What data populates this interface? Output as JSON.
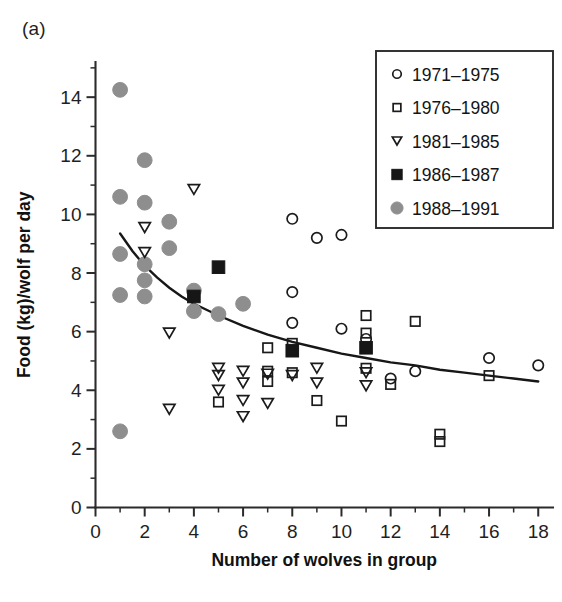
{
  "figure": {
    "panel_label": "(a)",
    "background_color": "#ffffff"
  },
  "chart_data": {
    "type": "scatter",
    "title": "(a)",
    "xlabel": "Number of wolves in group",
    "ylabel": "Food (kg)/wolf per day",
    "xlim": [
      0,
      18.6
    ],
    "ylim": [
      0,
      15.2
    ],
    "xticks": [
      0,
      2,
      4,
      6,
      8,
      10,
      12,
      14,
      16,
      18
    ],
    "xtick_labels": [
      "0",
      "2",
      "4",
      "6",
      "8",
      "10",
      "12",
      "14",
      "16",
      "18"
    ],
    "x_minor_ticks": [
      1,
      3,
      5,
      7,
      9,
      11,
      13,
      15,
      17
    ],
    "yticks": [
      0,
      2,
      4,
      6,
      8,
      10,
      12,
      14
    ],
    "ytick_labels": [
      "0",
      "2",
      "4",
      "6",
      "8",
      "10",
      "12",
      "14"
    ],
    "y_minor_ticks": [
      1,
      3,
      5,
      7,
      9,
      11,
      13,
      15
    ],
    "grid": false,
    "legend_position": "upper-right",
    "series": [
      {
        "name": "1971–1975",
        "marker": "open-circle",
        "color": "#1b1b1b",
        "points": [
          [
            8,
            9.85
          ],
          [
            9,
            9.2
          ],
          [
            10,
            9.3
          ],
          [
            8,
            7.35
          ],
          [
            8,
            6.3
          ],
          [
            10,
            6.1
          ],
          [
            11,
            5.75
          ],
          [
            12,
            4.4
          ],
          [
            13,
            4.65
          ],
          [
            16,
            5.1
          ],
          [
            18,
            4.85
          ]
        ]
      },
      {
        "name": "1976–1980",
        "marker": "open-square",
        "color": "#1b1b1b",
        "points": [
          [
            5,
            3.6
          ],
          [
            7,
            5.45
          ],
          [
            7,
            4.65
          ],
          [
            7,
            4.3
          ],
          [
            8,
            5.6
          ],
          [
            8,
            4.6
          ],
          [
            9,
            3.65
          ],
          [
            10,
            2.95
          ],
          [
            11,
            6.55
          ],
          [
            11,
            5.95
          ],
          [
            11,
            4.75
          ],
          [
            12,
            4.2
          ],
          [
            13,
            6.35
          ],
          [
            14,
            2.5
          ],
          [
            14,
            2.25
          ],
          [
            16,
            4.5
          ]
        ]
      },
      {
        "name": "1981–1985",
        "marker": "open-triangle-down",
        "color": "#1b1b1b",
        "points": [
          [
            4,
            10.85
          ],
          [
            2,
            9.55
          ],
          [
            2,
            8.7
          ],
          [
            3,
            5.95
          ],
          [
            3,
            3.35
          ],
          [
            5,
            4.75
          ],
          [
            6,
            4.65
          ],
          [
            6,
            4.25
          ],
          [
            5,
            4.5
          ],
          [
            5,
            4.0
          ],
          [
            6,
            3.65
          ],
          [
            6,
            3.1
          ],
          [
            7,
            4.55
          ],
          [
            7,
            3.55
          ],
          [
            8,
            4.5
          ],
          [
            9,
            4.75
          ],
          [
            9,
            4.25
          ],
          [
            11,
            4.6
          ],
          [
            11,
            4.15
          ]
        ]
      },
      {
        "name": "1986–1987",
        "marker": "filled-square",
        "color": "#161616",
        "points": [
          [
            5,
            8.2
          ],
          [
            4,
            7.2
          ],
          [
            8,
            5.35
          ],
          [
            11,
            5.45
          ]
        ]
      },
      {
        "name": "1988–1991",
        "marker": "filled-circle",
        "color": "#8e8e8e",
        "points": [
          [
            1,
            14.25
          ],
          [
            2,
            11.85
          ],
          [
            1,
            10.6
          ],
          [
            2,
            10.4
          ],
          [
            3,
            9.75
          ],
          [
            3,
            8.85
          ],
          [
            1,
            8.65
          ],
          [
            2,
            8.3
          ],
          [
            2,
            7.75
          ],
          [
            1,
            7.25
          ],
          [
            2,
            7.2
          ],
          [
            4,
            7.4
          ],
          [
            4,
            6.7
          ],
          [
            5,
            6.6
          ],
          [
            6,
            6.95
          ],
          [
            1,
            2.6
          ]
        ]
      }
    ],
    "fit_curve": {
      "description": "declining power/exponential trend line",
      "points": [
        [
          1.0,
          9.35
        ],
        [
          1.5,
          8.75
        ],
        [
          2.0,
          8.25
        ],
        [
          2.5,
          7.85
        ],
        [
          3.0,
          7.5
        ],
        [
          3.5,
          7.2
        ],
        [
          4.0,
          6.95
        ],
        [
          5.0,
          6.55
        ],
        [
          6.0,
          6.2
        ],
        [
          7.0,
          5.9
        ],
        [
          8.0,
          5.65
        ],
        [
          9.0,
          5.45
        ],
        [
          10.0,
          5.25
        ],
        [
          11.0,
          5.1
        ],
        [
          12.0,
          4.95
        ],
        [
          13.0,
          4.85
        ],
        [
          14.0,
          4.7
        ],
        [
          15.0,
          4.6
        ],
        [
          16.0,
          4.5
        ],
        [
          17.0,
          4.4
        ],
        [
          18.0,
          4.3
        ]
      ]
    }
  },
  "legend": {
    "entries": [
      {
        "label": "1971–1975",
        "marker": "open-circle"
      },
      {
        "label": "1976–1980",
        "marker": "open-square"
      },
      {
        "label": "1981–1985",
        "marker": "open-triangle-down"
      },
      {
        "label": "1986–1987",
        "marker": "filled-square"
      },
      {
        "label": "1988–1991",
        "marker": "filled-circle"
      }
    ]
  }
}
